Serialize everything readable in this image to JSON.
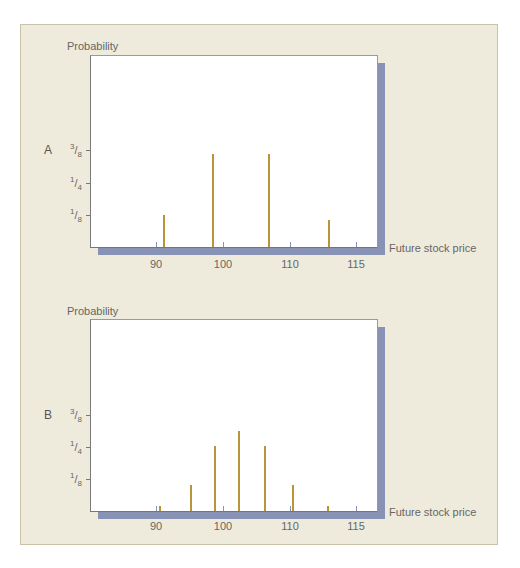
{
  "colors": {
    "panel_bg": "#efebdc",
    "plot_bg": "#ffffff",
    "bar": "#b8943a",
    "shadow": "#8892b5"
  },
  "chart_data": [
    {
      "type": "bar",
      "panel": "A",
      "title": "",
      "ylabel": "Probability",
      "xlabel": "Future stock price",
      "yticks": [
        "1/8",
        "1/4",
        "3/8"
      ],
      "ytick_values": [
        0.125,
        0.25,
        0.375
      ],
      "xticks": [
        90,
        100,
        110,
        115
      ],
      "xlim": [
        80,
        117
      ],
      "ylim": [
        0,
        0.56
      ],
      "grid": false,
      "x": [
        91,
        98.4,
        106.7,
        115.6
      ],
      "values": [
        0.125,
        0.36,
        0.36,
        0.105
      ]
    },
    {
      "type": "bar",
      "panel": "B",
      "title": "",
      "ylabel": "Probability",
      "xlabel": "Future stock price",
      "yticks": [
        "1/8",
        "1/4",
        "3/8"
      ],
      "ytick_values": [
        0.125,
        0.25,
        0.375
      ],
      "xticks": [
        90,
        100,
        110,
        115
      ],
      "xlim": [
        80,
        117
      ],
      "ylim": [
        0,
        0.56
      ],
      "grid": false,
      "x": [
        90.5,
        95.1,
        98.7,
        102.2,
        106.1,
        110.3,
        115.5
      ],
      "values": [
        0.02,
        0.1,
        0.25,
        0.31,
        0.25,
        0.1,
        0.02
      ]
    }
  ],
  "charts": [
    {
      "letter": "A",
      "ylabel": "Probability",
      "xlabel": "Future stock price",
      "yticks": [
        {
          "num": "3",
          "den": "8"
        },
        {
          "num": "1",
          "den": "4"
        },
        {
          "num": "1",
          "den": "8"
        }
      ],
      "xticks": [
        "90",
        "100",
        "110",
        "115"
      ]
    },
    {
      "letter": "B",
      "ylabel": "Probability",
      "xlabel": "Future stock price",
      "yticks": [
        {
          "num": "3",
          "den": "8"
        },
        {
          "num": "1",
          "den": "4"
        },
        {
          "num": "1",
          "den": "8"
        }
      ],
      "xticks": [
        "90",
        "100",
        "110",
        "115"
      ]
    }
  ]
}
